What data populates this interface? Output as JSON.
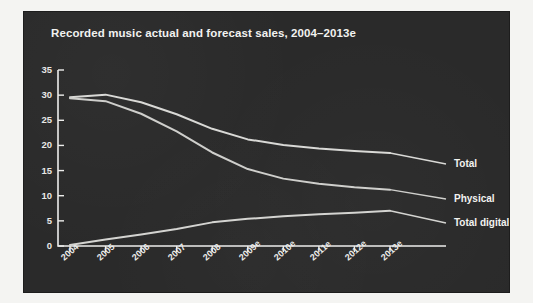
{
  "chart_data": {
    "type": "line",
    "title": "Recorded music actual and forecast sales, 2004–2013e",
    "xlabel": "",
    "ylabel": "",
    "categories": [
      "2004",
      "2005",
      "2006",
      "2007",
      "2008",
      "2009e",
      "2010e",
      "2011e",
      "2012e",
      "2013e"
    ],
    "ylim": [
      0,
      35
    ],
    "yticks": [
      0,
      5,
      10,
      15,
      20,
      25,
      30,
      35
    ],
    "grid": false,
    "legend_position": "right-inline-labels",
    "series": [
      {
        "name": "Total",
        "values": [
          29.6,
          30.1,
          28.6,
          26.2,
          23.3,
          21.2,
          20.1,
          19.4,
          18.9,
          18.5
        ],
        "color": "#d9d9d6"
      },
      {
        "name": "Physical",
        "values": [
          29.4,
          28.8,
          26.3,
          22.8,
          18.6,
          15.3,
          13.4,
          12.4,
          11.7,
          11.2
        ],
        "color": "#cfcfcc"
      },
      {
        "name": "Total digital",
        "values": [
          0.2,
          1.3,
          2.3,
          3.4,
          4.7,
          5.4,
          5.9,
          6.3,
          6.6,
          7.0
        ],
        "color": "#d4d4d1"
      }
    ]
  },
  "axis": {
    "y_tick_labels": [
      "35",
      "30",
      "25",
      "20",
      "15",
      "10",
      "5",
      "0"
    ],
    "x_tick_labels": [
      "2004",
      "2005",
      "2006",
      "2007",
      "2008",
      "2009e",
      "2010e",
      "2011e",
      "2012e",
      "2013e"
    ]
  },
  "series_labels": [
    {
      "text": "Total"
    },
    {
      "text": "Physical"
    },
    {
      "text": "Total digital"
    }
  ],
  "colors": {
    "panel_background": "#2a2a2a",
    "page_background": "#f4f4f2",
    "axis": "#ededeb",
    "text": "#f2f2f0",
    "line_total": "#d9d9d6",
    "line_physical": "#cfcfcc",
    "line_digital": "#d4d4d1"
  }
}
